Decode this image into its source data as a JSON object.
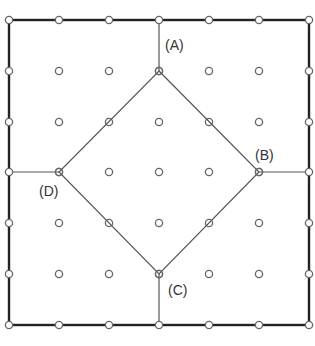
{
  "diagram": {
    "type": "grid-partition",
    "grid": {
      "columns": 7,
      "rows": 7,
      "x": [
        9,
        59,
        109,
        159,
        209,
        259,
        309
      ],
      "y": [
        20,
        71,
        122,
        172,
        223,
        274,
        325
      ],
      "point_radius": 3.6
    },
    "outer_border": {
      "x1": 9,
      "y1": 20,
      "x2": 309,
      "y2": 325
    },
    "diamond": {
      "vertices": [
        {
          "id": "A",
          "col": 3,
          "row": 1
        },
        {
          "id": "B",
          "col": 5,
          "row": 3
        },
        {
          "id": "C",
          "col": 3,
          "row": 5
        },
        {
          "id": "D",
          "col": 1,
          "row": 3
        }
      ]
    },
    "connectors": [
      {
        "from": {
          "col": 3,
          "row": 1
        },
        "to": {
          "col": 3,
          "row": 0
        }
      },
      {
        "from": {
          "col": 5,
          "row": 3
        },
        "to": {
          "col": 6,
          "row": 3
        }
      },
      {
        "from": {
          "col": 3,
          "row": 5
        },
        "to": {
          "col": 3,
          "row": 6
        }
      },
      {
        "from": {
          "col": 1,
          "row": 3
        },
        "to": {
          "col": 0,
          "row": 3
        }
      }
    ],
    "labels": {
      "A": {
        "text": "(A)",
        "left": 165,
        "top": 38
      },
      "B": {
        "text": "(B)",
        "left": 255,
        "top": 148
      },
      "C": {
        "text": "(C)",
        "left": 168,
        "top": 283
      },
      "D": {
        "text": "(D)",
        "left": 39,
        "top": 184
      }
    },
    "colors": {
      "border": "#222222",
      "lines": "#555555",
      "points": "#666666",
      "background": "#ffffff",
      "label": "#333333"
    }
  }
}
